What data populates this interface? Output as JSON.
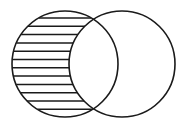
{
  "figure": {
    "kind": "venn-diagram",
    "shaded_region_label": "A minus B",
    "background_color": "#ffffff"
  },
  "canvas": {
    "width": 188,
    "height": 127
  },
  "style": {
    "outline_color": "#1a1a1a",
    "outline_width": 1.6,
    "hatch_color": "#1a1a1a",
    "hatch_width": 1.5,
    "fill_color": "none"
  },
  "circles": [
    {
      "name": "left-circle",
      "set_label": "A",
      "cx": 65,
      "cy": 64,
      "r": 53,
      "shaded": true
    },
    {
      "name": "right-circle",
      "set_label": "B",
      "cx": 122,
      "cy": 64,
      "r": 53,
      "shaded": false
    }
  ],
  "intersection": {
    "name": "lens-region",
    "shaded": false,
    "upper_crossing": {
      "x": 93.5,
      "y": 14.2
    },
    "lower_crossing": {
      "x": 93.5,
      "y": 113.8
    }
  },
  "hatching": {
    "orientation": "horizontal",
    "line_count": 12,
    "spacing": 8.3,
    "first_line_y": 18,
    "lines_y": [
      18,
      26.3,
      34.6,
      42.9,
      51.2,
      59.5,
      67.8,
      76.1,
      84.4,
      92.7,
      101.0,
      109.3
    ]
  }
}
